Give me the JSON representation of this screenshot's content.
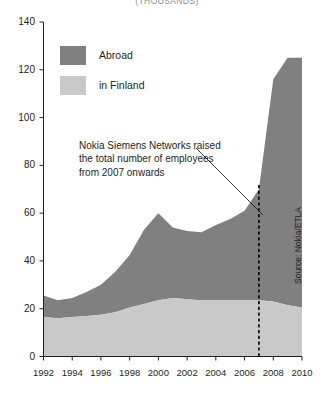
{
  "title": "(THOUSANDS)",
  "legend": {
    "position": "top-left",
    "items": [
      {
        "label": "Abroad",
        "color": "#808080",
        "icon": "legend-swatch-icon"
      },
      {
        "label": "in Finland",
        "color": "#c9c9c9",
        "icon": "legend-swatch-icon"
      }
    ]
  },
  "annotation": {
    "line1": "Nokia Siemens Networks raised",
    "line2": "the total number of employees",
    "line3": "from 2007 onwards",
    "marker_year": 2007
  },
  "source": "Source: Nokia/ETLA",
  "axes": {
    "y_ticks": [
      "0",
      "20",
      "40",
      "60",
      "80",
      "100",
      "120",
      "140"
    ],
    "x_ticks": [
      "1992",
      "1994",
      "1996",
      "1998",
      "2000",
      "2002",
      "2004",
      "2006",
      "2008",
      "2010"
    ]
  },
  "chart_data": {
    "type": "area",
    "title": "(THOUSANDS)",
    "subtitle": "",
    "xlabel": "",
    "ylabel": "",
    "stacked": true,
    "grid": false,
    "legend_position": "top-left",
    "xlim": [
      1992,
      2010
    ],
    "ylim": [
      0,
      140
    ],
    "x": [
      1992,
      1993,
      1994,
      1995,
      1996,
      1997,
      1998,
      1999,
      2000,
      2001,
      2002,
      2003,
      2004,
      2005,
      2006,
      2007,
      2008,
      2009,
      2010
    ],
    "series": [
      {
        "name": "in Finland",
        "color": "#c9c9c9",
        "values": [
          16.5,
          16.0,
          16.5,
          17.0,
          17.5,
          18.5,
          20.5,
          22.0,
          23.5,
          24.5,
          24.0,
          23.5,
          23.5,
          23.5,
          23.5,
          23.5,
          23.0,
          21.5,
          20.5
        ]
      },
      {
        "name": "Abroad",
        "color": "#808080",
        "values": [
          9.0,
          7.5,
          8.0,
          10.0,
          12.5,
          17.0,
          22.0,
          31.0,
          36.5,
          29.5,
          28.5,
          28.5,
          31.5,
          34.0,
          37.5,
          46.5,
          93.0,
          103.5,
          104.5
        ]
      }
    ],
    "totals": [
      25.5,
      23.5,
      24.5,
      27.0,
      30.0,
      35.5,
      42.5,
      53.0,
      60.0,
      54.0,
      52.5,
      52.0,
      55.0,
      57.5,
      61.0,
      70.0,
      116.0,
      125.0,
      125.0
    ],
    "annotations": [
      {
        "text": "Nokia Siemens Networks raised the total number of employees from 2007 onwards",
        "marker": "dashed-vertical-line",
        "at_x": 2007
      }
    ]
  }
}
